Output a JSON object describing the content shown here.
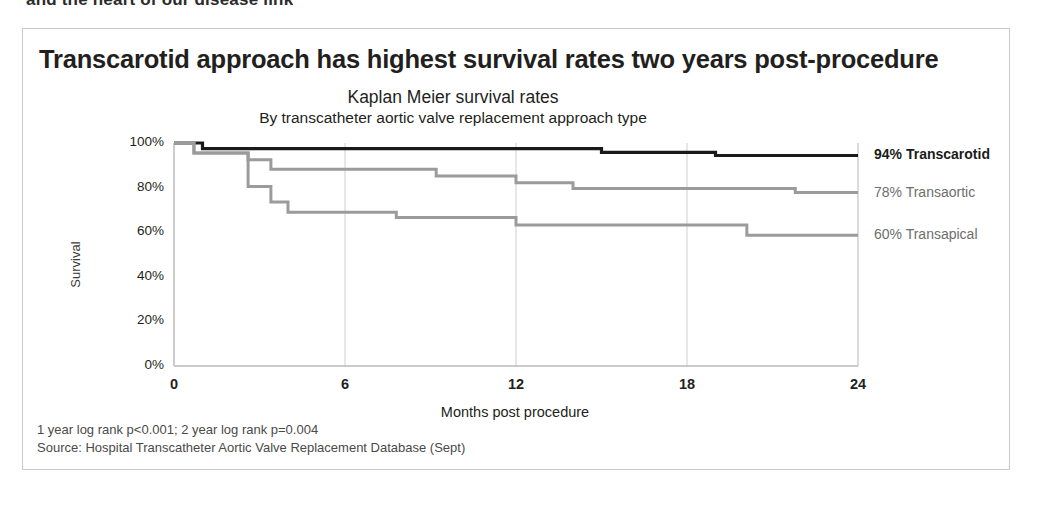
{
  "top_fragment": "and the heart of our disease link",
  "card": {
    "headline": "Transcarotid approach has highest survival rates two years post-procedure",
    "footnotes": [
      "1 year log rank p<0.001; 2 year log rank p=0.004",
      "Source: Hospital Transcatheter Aortic Valve Replacement Database (Sept)"
    ]
  },
  "chart_data": {
    "type": "line",
    "subtype": "kaplan-meier-step",
    "title": "Kaplan Meier survival rates",
    "subtitle": "By transcatheter aortic valve replacement approach type",
    "xlabel": "Months post procedure",
    "ylabel": "Survival",
    "xlim": [
      0,
      24
    ],
    "ylim": [
      0,
      100
    ],
    "xticks": [
      0,
      6,
      12,
      18,
      24
    ],
    "xtick_labels": [
      "0",
      "6",
      "12",
      "18",
      "24"
    ],
    "yticks": [
      0,
      20,
      40,
      60,
      80,
      100
    ],
    "ytick_labels": [
      "0%",
      "20%",
      "40%",
      "60%",
      "80%",
      "100%"
    ],
    "grid": "vertical-only",
    "legend_position": "right-of-plot",
    "series": [
      {
        "name": "Transcarotid",
        "end_label": "94% Transcarotid",
        "end_value": 94,
        "color": "#1a1a1a",
        "width": 3.2,
        "emphasis": true,
        "points": [
          [
            0,
            100
          ],
          [
            1.0,
            100
          ],
          [
            1.0,
            97.5
          ],
          [
            15.0,
            97.5
          ],
          [
            15.0,
            95.8
          ],
          [
            19.0,
            95.8
          ],
          [
            19.0,
            94.4
          ],
          [
            24,
            94.4
          ]
        ]
      },
      {
        "name": "Transaortic",
        "end_label": "78% Transaortic",
        "end_value": 78,
        "color": "#9b9b9b",
        "width": 3.0,
        "emphasis": false,
        "points": [
          [
            0,
            100
          ],
          [
            0.7,
            100
          ],
          [
            0.7,
            95.5
          ],
          [
            2.6,
            95.5
          ],
          [
            2.6,
            92.5
          ],
          [
            3.4,
            92.5
          ],
          [
            3.4,
            88.2
          ],
          [
            9.2,
            88.2
          ],
          [
            9.2,
            85.2
          ],
          [
            12.0,
            85.2
          ],
          [
            12.0,
            82.2
          ],
          [
            14.0,
            82.2
          ],
          [
            14.0,
            79.6
          ],
          [
            21.8,
            79.6
          ],
          [
            21.8,
            77.8
          ],
          [
            24,
            77.8
          ]
        ]
      },
      {
        "name": "Transapical",
        "end_label": "60% Transapical",
        "end_value": 60,
        "color": "#9b9b9b",
        "width": 3.0,
        "emphasis": false,
        "points": [
          [
            0,
            100
          ],
          [
            0.7,
            100
          ],
          [
            0.7,
            95.5
          ],
          [
            2.6,
            95.5
          ],
          [
            2.6,
            80.5
          ],
          [
            3.4,
            80.5
          ],
          [
            3.4,
            73.5
          ],
          [
            4.0,
            73.5
          ],
          [
            4.0,
            69.0
          ],
          [
            7.8,
            69.0
          ],
          [
            7.8,
            66.6
          ],
          [
            12.0,
            66.6
          ],
          [
            12.0,
            63.2
          ],
          [
            20.1,
            63.2
          ],
          [
            20.1,
            58.6
          ],
          [
            24,
            58.6
          ]
        ]
      }
    ],
    "series_label_positions": [
      {
        "label_key": 0,
        "y_pct": 94
      },
      {
        "label_key": 1,
        "y_pct": 78
      },
      {
        "label_key": 2,
        "y_pct": 60
      }
    ]
  }
}
